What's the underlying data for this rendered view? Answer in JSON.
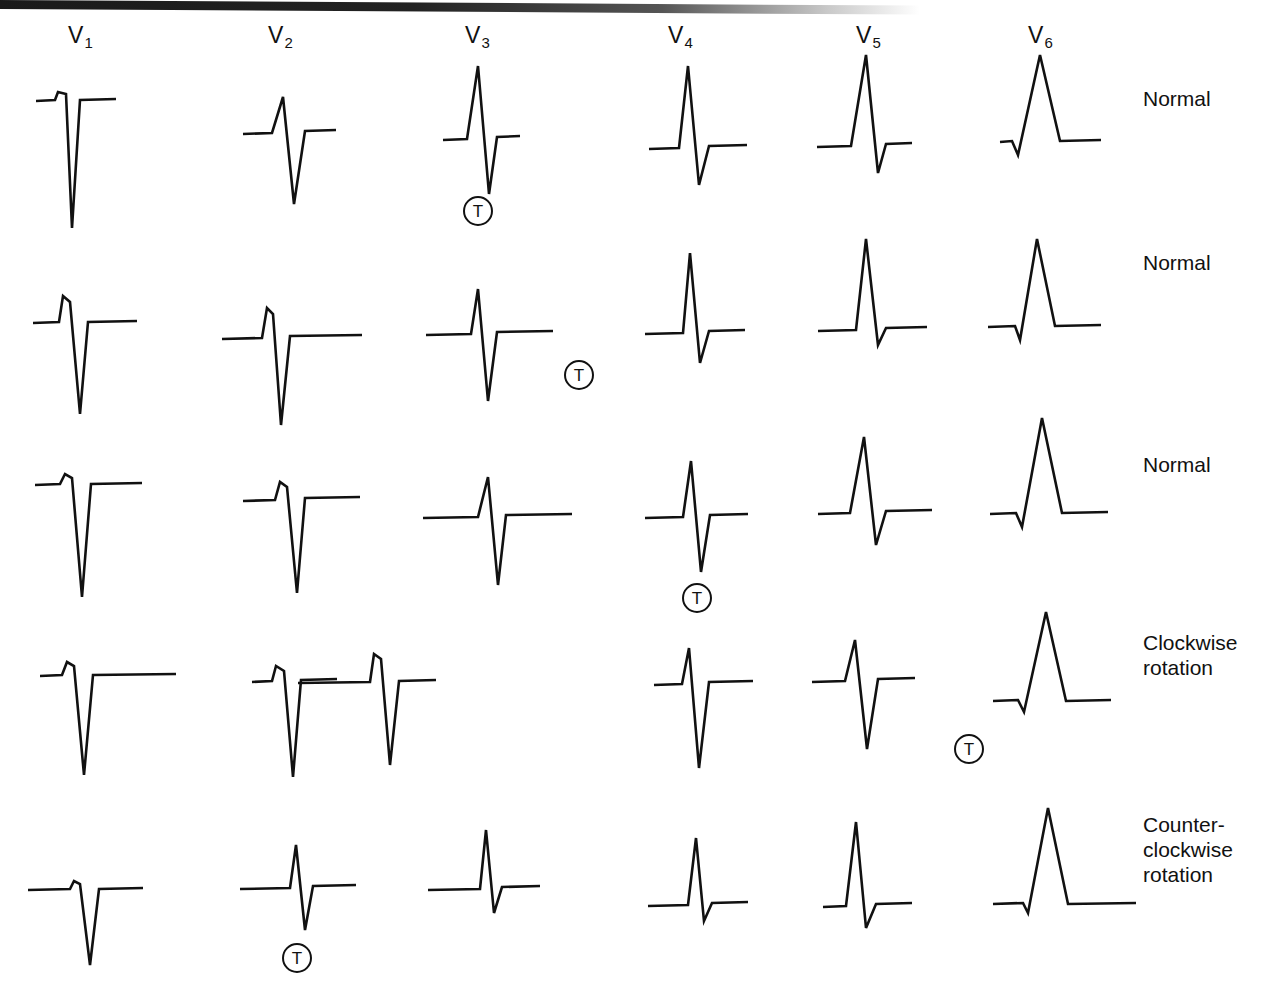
{
  "figure": {
    "background": "#ffffff",
    "trace_color": "#111111",
    "width": 1268,
    "height": 983
  },
  "columns": [
    {
      "label": "V",
      "sub": "1",
      "x": 68,
      "y": 22
    },
    {
      "label": "V",
      "sub": "2",
      "x": 268,
      "y": 22
    },
    {
      "label": "V",
      "sub": "3",
      "x": 465,
      "y": 22
    },
    {
      "label": "V",
      "sub": "4",
      "x": 668,
      "y": 22
    },
    {
      "label": "V",
      "sub": "5",
      "x": 856,
      "y": 22
    },
    {
      "label": "V",
      "sub": "6",
      "x": 1028,
      "y": 22
    }
  ],
  "row_labels": [
    {
      "text": "Normal",
      "x": 1143,
      "y": 86
    },
    {
      "text": "Normal",
      "x": 1143,
      "y": 250
    },
    {
      "text": "Normal",
      "x": 1143,
      "y": 452
    },
    {
      "text": "Clockwise\nrotation",
      "x": 1143,
      "y": 630
    },
    {
      "text": "Counter-\nclockwise\nrotation",
      "x": 1143,
      "y": 812
    }
  ],
  "t_markers": [
    {
      "row": 1,
      "lead": "V3",
      "label": "T",
      "x": 463,
      "y": 196
    },
    {
      "row": 2,
      "lead": "V3",
      "label": "T",
      "x": 564,
      "y": 360
    },
    {
      "row": 3,
      "lead": "V4",
      "label": "T",
      "x": 682,
      "y": 583
    },
    {
      "row": 4,
      "lead": "V5",
      "label": "T",
      "x": 954,
      "y": 734
    },
    {
      "row": 5,
      "lead": "V2",
      "label": "T",
      "x": 282,
      "y": 943
    }
  ],
  "chart_data": {
    "type": "line",
    "xlabel": "",
    "ylabel": "",
    "grid": false,
    "legend": "none",
    "leads": [
      "V1",
      "V2",
      "V3",
      "V4",
      "V5",
      "V6"
    ],
    "rows": [
      "Normal",
      "Normal",
      "Normal",
      "Clockwise rotation",
      "Counter-clockwise rotation"
    ],
    "transition_zone": [
      "V3",
      "V3",
      "V4",
      "V5",
      "V2"
    ],
    "traces": [
      {
        "row": 0,
        "lead": "V1",
        "baseline_y": 100,
        "points": [
          [
            36,
            101
          ],
          [
            55,
            100
          ],
          [
            58,
            92
          ],
          [
            66,
            94
          ],
          [
            72,
            228
          ],
          [
            80,
            100
          ],
          [
            116,
            99
          ]
        ]
      },
      {
        "row": 0,
        "lead": "V2",
        "baseline_y": 133,
        "points": [
          [
            243,
            134
          ],
          [
            272,
            133
          ],
          [
            283,
            97
          ],
          [
            294,
            204
          ],
          [
            305,
            131
          ],
          [
            336,
            130
          ]
        ]
      },
      {
        "row": 0,
        "lead": "V3",
        "baseline_y": 139,
        "points": [
          [
            443,
            140
          ],
          [
            467,
            139
          ],
          [
            478,
            66
          ],
          [
            489,
            194
          ],
          [
            497,
            137
          ],
          [
            520,
            136
          ]
        ]
      },
      {
        "row": 0,
        "lead": "V4",
        "baseline_y": 148,
        "points": [
          [
            649,
            149
          ],
          [
            679,
            148
          ],
          [
            688,
            66
          ],
          [
            699,
            185
          ],
          [
            709,
            146
          ],
          [
            747,
            145
          ]
        ]
      },
      {
        "row": 0,
        "lead": "V5",
        "baseline_y": 146,
        "points": [
          [
            817,
            147
          ],
          [
            851,
            146
          ],
          [
            866,
            55
          ],
          [
            878,
            173
          ],
          [
            886,
            144
          ],
          [
            912,
            143
          ]
        ]
      },
      {
        "row": 0,
        "lead": "V6",
        "baseline_y": 143,
        "points": [
          [
            1000,
            142
          ],
          [
            1012,
            141
          ],
          [
            1018,
            155
          ],
          [
            1040,
            55
          ],
          [
            1060,
            141
          ],
          [
            1101,
            140
          ]
        ]
      },
      {
        "row": 1,
        "lead": "V1",
        "baseline_y": 322,
        "points": [
          [
            33,
            323
          ],
          [
            59,
            322
          ],
          [
            63,
            296
          ],
          [
            70,
            302
          ],
          [
            80,
            414
          ],
          [
            88,
            322
          ],
          [
            137,
            321
          ]
        ]
      },
      {
        "row": 1,
        "lead": "V2",
        "baseline_y": 338,
        "points": [
          [
            222,
            339
          ],
          [
            262,
            338
          ],
          [
            267,
            308
          ],
          [
            273,
            314
          ],
          [
            281,
            425
          ],
          [
            290,
            336
          ],
          [
            362,
            335
          ]
        ]
      },
      {
        "row": 1,
        "lead": "V3",
        "baseline_y": 334,
        "points": [
          [
            426,
            335
          ],
          [
            471,
            334
          ],
          [
            478,
            289
          ],
          [
            488,
            401
          ],
          [
            497,
            332
          ],
          [
            553,
            331
          ]
        ]
      },
      {
        "row": 1,
        "lead": "V4",
        "baseline_y": 333,
        "points": [
          [
            645,
            334
          ],
          [
            683,
            333
          ],
          [
            690,
            253
          ],
          [
            700,
            363
          ],
          [
            709,
            331
          ],
          [
            745,
            330
          ]
        ]
      },
      {
        "row": 1,
        "lead": "V5",
        "baseline_y": 330,
        "points": [
          [
            818,
            331
          ],
          [
            856,
            330
          ],
          [
            866,
            239
          ],
          [
            878,
            345
          ],
          [
            886,
            328
          ],
          [
            927,
            327
          ]
        ]
      },
      {
        "row": 1,
        "lead": "V6",
        "baseline_y": 328,
        "points": [
          [
            988,
            327
          ],
          [
            1015,
            326
          ],
          [
            1020,
            340
          ],
          [
            1037,
            239
          ],
          [
            1055,
            326
          ],
          [
            1101,
            325
          ]
        ]
      },
      {
        "row": 2,
        "lead": "V1",
        "baseline_y": 484,
        "points": [
          [
            35,
            485
          ],
          [
            60,
            484
          ],
          [
            65,
            474
          ],
          [
            72,
            478
          ],
          [
            82,
            597
          ],
          [
            91,
            484
          ],
          [
            142,
            483
          ]
        ]
      },
      {
        "row": 2,
        "lead": "V2",
        "baseline_y": 500,
        "points": [
          [
            243,
            501
          ],
          [
            275,
            500
          ],
          [
            280,
            482
          ],
          [
            287,
            487
          ],
          [
            297,
            593
          ],
          [
            305,
            498
          ],
          [
            360,
            497
          ]
        ]
      },
      {
        "row": 2,
        "lead": "V3",
        "baseline_y": 517,
        "points": [
          [
            423,
            518
          ],
          [
            478,
            517
          ],
          [
            488,
            477
          ],
          [
            498,
            585
          ],
          [
            506,
            515
          ],
          [
            572,
            514
          ]
        ]
      },
      {
        "row": 2,
        "lead": "V4",
        "baseline_y": 517,
        "points": [
          [
            645,
            518
          ],
          [
            683,
            517
          ],
          [
            691,
            461
          ],
          [
            701,
            572
          ],
          [
            710,
            515
          ],
          [
            748,
            514
          ]
        ]
      },
      {
        "row": 2,
        "lead": "V5",
        "baseline_y": 513,
        "points": [
          [
            818,
            514
          ],
          [
            850,
            513
          ],
          [
            864,
            437
          ],
          [
            876,
            545
          ],
          [
            886,
            511
          ],
          [
            932,
            510
          ]
        ]
      },
      {
        "row": 2,
        "lead": "V6",
        "baseline_y": 515,
        "points": [
          [
            990,
            514
          ],
          [
            1016,
            513
          ],
          [
            1022,
            527
          ],
          [
            1042,
            418
          ],
          [
            1062,
            513
          ],
          [
            1108,
            512
          ]
        ]
      },
      {
        "row": 3,
        "lead": "V1",
        "baseline_y": 675,
        "points": [
          [
            40,
            676
          ],
          [
            62,
            675
          ],
          [
            67,
            662
          ],
          [
            74,
            666
          ],
          [
            84,
            775
          ],
          [
            93,
            675
          ],
          [
            176,
            674
          ]
        ]
      },
      {
        "row": 3,
        "lead": "V2",
        "baseline_y": 681,
        "points": [
          [
            252,
            682
          ],
          [
            272,
            681
          ],
          [
            276,
            666
          ],
          [
            284,
            671
          ],
          [
            293,
            777
          ],
          [
            301,
            680
          ],
          [
            337,
            679
          ]
        ]
      },
      {
        "row": 3,
        "lead": "V3",
        "baseline_y": 683,
        "points": [
          [
            298,
            683
          ],
          [
            370,
            682
          ],
          [
            374,
            654
          ],
          [
            381,
            659
          ],
          [
            390,
            765
          ],
          [
            399,
            681
          ],
          [
            436,
            680
          ]
        ]
      },
      {
        "row": 3,
        "lead": "V4",
        "baseline_y": 684,
        "points": [
          [
            654,
            685
          ],
          [
            682,
            684
          ],
          [
            689,
            648
          ],
          [
            699,
            768
          ],
          [
            709,
            682
          ],
          [
            753,
            681
          ]
        ]
      },
      {
        "row": 3,
        "lead": "V5",
        "baseline_y": 681,
        "points": [
          [
            812,
            682
          ],
          [
            845,
            681
          ],
          [
            855,
            640
          ],
          [
            867,
            749
          ],
          [
            878,
            679
          ],
          [
            915,
            678
          ]
        ]
      },
      {
        "row": 3,
        "lead": "V6",
        "baseline_y": 702,
        "points": [
          [
            993,
            701
          ],
          [
            1018,
            700
          ],
          [
            1024,
            712
          ],
          [
            1046,
            612
          ],
          [
            1066,
            701
          ],
          [
            1111,
            700
          ]
        ]
      },
      {
        "row": 4,
        "lead": "V1",
        "baseline_y": 889,
        "points": [
          [
            28,
            890
          ],
          [
            70,
            889
          ],
          [
            74,
            881
          ],
          [
            80,
            884
          ],
          [
            90,
            965
          ],
          [
            99,
            889
          ],
          [
            143,
            888
          ]
        ]
      },
      {
        "row": 4,
        "lead": "V2",
        "baseline_y": 888,
        "points": [
          [
            240,
            889
          ],
          [
            290,
            888
          ],
          [
            296,
            845
          ],
          [
            305,
            930
          ],
          [
            313,
            886
          ],
          [
            356,
            885
          ]
        ]
      },
      {
        "row": 4,
        "lead": "V3",
        "baseline_y": 889,
        "points": [
          [
            428,
            890
          ],
          [
            480,
            889
          ],
          [
            486,
            830
          ],
          [
            494,
            913
          ],
          [
            502,
            887
          ],
          [
            540,
            886
          ]
        ]
      },
      {
        "row": 4,
        "lead": "V4",
        "baseline_y": 905,
        "points": [
          [
            648,
            906
          ],
          [
            688,
            905
          ],
          [
            696,
            838
          ],
          [
            704,
            921
          ],
          [
            712,
            903
          ],
          [
            748,
            902
          ]
        ]
      },
      {
        "row": 4,
        "lead": "V5",
        "baseline_y": 906,
        "points": [
          [
            823,
            907
          ],
          [
            846,
            906
          ],
          [
            856,
            822
          ],
          [
            866,
            928
          ],
          [
            876,
            904
          ],
          [
            912,
            903
          ]
        ]
      },
      {
        "row": 4,
        "lead": "V6",
        "baseline_y": 905,
        "points": [
          [
            993,
            904
          ],
          [
            1023,
            903
          ],
          [
            1028,
            913
          ],
          [
            1048,
            808
          ],
          [
            1068,
            904
          ],
          [
            1136,
            903
          ]
        ]
      }
    ]
  }
}
